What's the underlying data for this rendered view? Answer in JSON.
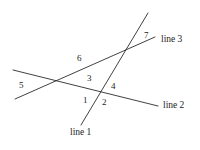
{
  "diagram": {
    "background_color": "#ffffff",
    "stroke_color": "#2b2b2b",
    "text_color": "#1c1c1c",
    "lines": [
      {
        "name": "line 1",
        "label": "line 1",
        "x1": 148,
        "y1": 13,
        "x2": 81,
        "y2": 125
      },
      {
        "name": "line 2",
        "label": "line 2",
        "x1": 13,
        "y1": 70,
        "x2": 158,
        "y2": 106
      },
      {
        "name": "line 3",
        "label": "line 3",
        "x1": 15,
        "y1": 99,
        "x2": 155,
        "y2": 37
      }
    ],
    "line_labels": [
      {
        "text": "line 1",
        "x": 70,
        "y": 128
      },
      {
        "text": "line 2",
        "x": 163,
        "y": 101
      },
      {
        "text": "line 3",
        "x": 161,
        "y": 35
      }
    ],
    "angle_labels": [
      {
        "text": "1",
        "x": 83,
        "y": 96
      },
      {
        "text": "2",
        "x": 102,
        "y": 98
      },
      {
        "text": "3",
        "x": 87,
        "y": 74
      },
      {
        "text": "4",
        "x": 111,
        "y": 82
      },
      {
        "text": "5",
        "x": 19,
        "y": 81
      },
      {
        "text": "6",
        "x": 77,
        "y": 54
      },
      {
        "text": "7",
        "x": 144,
        "y": 31
      }
    ],
    "intersections": [
      {
        "name": "line2-line3",
        "x": 61,
        "y": 82
      },
      {
        "name": "line1-line3",
        "x": 123,
        "y": 54
      },
      {
        "name": "line1-line2",
        "x": 101,
        "y": 92
      }
    ]
  }
}
